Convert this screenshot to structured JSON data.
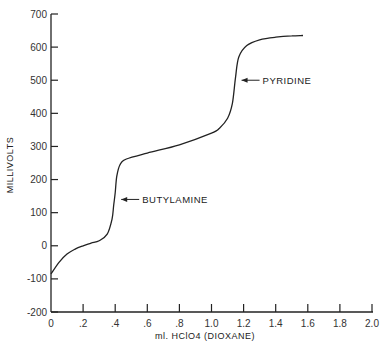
{
  "chart_data": {
    "type": "line",
    "title": "",
    "xlabel": "ml. HClO4 (DIOXANE)",
    "ylabel": "MILLIVOLTS",
    "xlim": [
      0,
      2.0
    ],
    "ylim": [
      -200,
      700
    ],
    "grid": false,
    "legend": null,
    "x_ticks": [
      "0",
      ".2",
      ".4",
      ".6",
      ".8",
      "1.0",
      "1.2",
      "1.4",
      "1.6",
      "1.8",
      "2.0"
    ],
    "x_tick_values": [
      0,
      0.2,
      0.4,
      0.6,
      0.8,
      1.0,
      1.2,
      1.4,
      1.6,
      1.8,
      2.0
    ],
    "y_ticks": [
      "700",
      "600",
      "500",
      "400",
      "300",
      "200",
      "100",
      "0",
      "-100",
      "-200"
    ],
    "y_tick_values": [
      700,
      600,
      500,
      400,
      300,
      200,
      100,
      0,
      -100,
      -200
    ],
    "series": [
      {
        "name": "Titration curve",
        "x": [
          0,
          0.05,
          0.1,
          0.15,
          0.2,
          0.25,
          0.3,
          0.35,
          0.38,
          0.39,
          0.4,
          0.41,
          0.43,
          0.47,
          0.6,
          0.8,
          1.0,
          1.05,
          1.1,
          1.13,
          1.15,
          1.17,
          1.22,
          1.3,
          1.4,
          1.5,
          1.57
        ],
        "y": [
          -85,
          -50,
          -25,
          -10,
          0,
          8,
          15,
          35,
          80,
          120,
          160,
          210,
          245,
          262,
          280,
          305,
          340,
          355,
          385,
          430,
          510,
          570,
          605,
          622,
          630,
          634,
          635
        ]
      }
    ],
    "annotations": [
      {
        "text": "BUTYLAMINE",
        "x": 0.4,
        "y": 140
      },
      {
        "text": "PYRIDINE",
        "x": 1.15,
        "y": 500
      }
    ]
  }
}
